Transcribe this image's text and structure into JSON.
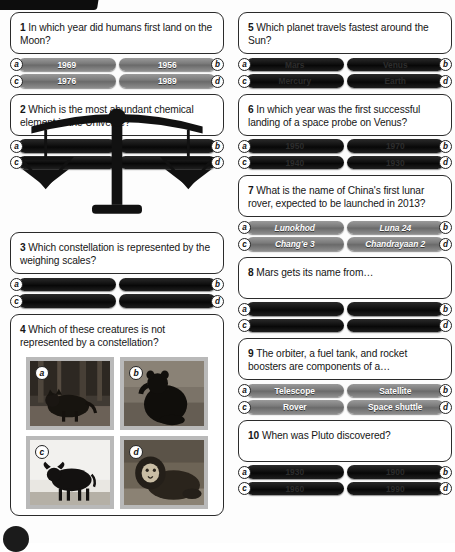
{
  "page": {
    "background_color": "#fdfdfd",
    "card_border_color": "#2b2b2b",
    "answer_button_color": "#7b7b7b",
    "answer_button_redacted_color": "#101010",
    "accent_black": "#0d0d0d"
  },
  "decorations": {
    "top_bar_name": "black-corner-bar",
    "bottom_dot_name": "black-corner-dot",
    "scales_name": "weighing-scales-illustration"
  },
  "questions": [
    {
      "number": "1",
      "text": "In which year did humans first land on the Moon?",
      "redacted": false,
      "answers": [
        {
          "key": "a",
          "label": "1969",
          "side": "left"
        },
        {
          "key": "b",
          "label": "1956",
          "side": "right"
        },
        {
          "key": "c",
          "label": "1976",
          "side": "left"
        },
        {
          "key": "d",
          "label": "1989",
          "side": "right"
        }
      ]
    },
    {
      "number": "2",
      "text": "Which is the most abundant chemical element in the Universe?",
      "redacted": true,
      "answers": [
        {
          "key": "a",
          "label": "",
          "side": "left"
        },
        {
          "key": "b",
          "label": "",
          "side": "right"
        },
        {
          "key": "c",
          "label": "",
          "side": "left"
        },
        {
          "key": "d",
          "label": "",
          "side": "right"
        }
      ]
    },
    {
      "number": "3",
      "text": "Which constellation is represented by the weighing scales?",
      "redacted": true,
      "answers": [
        {
          "key": "a",
          "label": "",
          "side": "left"
        },
        {
          "key": "b",
          "label": "",
          "side": "right"
        },
        {
          "key": "c",
          "label": "",
          "side": "left"
        },
        {
          "key": "d",
          "label": "",
          "side": "right"
        }
      ]
    },
    {
      "number": "4",
      "text": "Which of these creatures is not represented by a constellation?",
      "redacted": false,
      "answers": [],
      "pictures": [
        {
          "key": "a",
          "subject": "wolf-photo"
        },
        {
          "key": "b",
          "subject": "bear-photo"
        },
        {
          "key": "c",
          "subject": "bull-photo"
        },
        {
          "key": "d",
          "subject": "lion-photo"
        }
      ]
    },
    {
      "number": "5",
      "text": "Which planet travels fastest around the Sun?",
      "redacted": false,
      "answers": [
        {
          "key": "a",
          "label": "Mars",
          "side": "left"
        },
        {
          "key": "b",
          "label": "Venus",
          "side": "right"
        },
        {
          "key": "c",
          "label": "Mercury",
          "side": "left"
        },
        {
          "key": "d",
          "label": "Earth",
          "side": "right"
        }
      ]
    },
    {
      "number": "6",
      "text": "In which year was the first successful landing of a space probe on Venus?",
      "redacted": true,
      "answers": [
        {
          "key": "a",
          "label": "1950",
          "side": "left"
        },
        {
          "key": "b",
          "label": "1970",
          "side": "right"
        },
        {
          "key": "c",
          "label": "1940",
          "side": "left"
        },
        {
          "key": "d",
          "label": "1930",
          "side": "right"
        }
      ]
    },
    {
      "number": "7",
      "text": "What is the name of China's first lunar rover, expected to be launched in 2013?",
      "redacted": false,
      "italic": true,
      "answers": [
        {
          "key": "a",
          "label": "Lunokhod",
          "side": "left"
        },
        {
          "key": "b",
          "label": "Luna 24",
          "side": "right"
        },
        {
          "key": "c",
          "label": "Chang'e 3",
          "side": "left"
        },
        {
          "key": "d",
          "label": "Chandrayaan 2",
          "side": "right"
        }
      ]
    },
    {
      "number": "8",
      "text": "Mars gets its name from…",
      "redacted": true,
      "answers": [
        {
          "key": "a",
          "label": "",
          "side": "left"
        },
        {
          "key": "b",
          "label": "",
          "side": "right"
        },
        {
          "key": "c",
          "label": "",
          "side": "left"
        },
        {
          "key": "d",
          "label": "",
          "side": "right"
        }
      ]
    },
    {
      "number": "9",
      "text": "The orbiter, a fuel tank, and rocket boosters are components of a…",
      "redacted": false,
      "answers": [
        {
          "key": "a",
          "label": "Telescope",
          "side": "left"
        },
        {
          "key": "b",
          "label": "Satellite",
          "side": "right"
        },
        {
          "key": "c",
          "label": "Rover",
          "side": "left"
        },
        {
          "key": "d",
          "label": "Space shuttle",
          "side": "right"
        }
      ]
    },
    {
      "number": "10",
      "text": "When was Pluto discovered?",
      "redacted": false,
      "answers": [
        {
          "key": "a",
          "label": "1930",
          "side": "left"
        },
        {
          "key": "b",
          "label": "1900",
          "side": "right"
        },
        {
          "key": "c",
          "label": "1960",
          "side": "left"
        },
        {
          "key": "d",
          "label": "1990",
          "side": "right"
        }
      ]
    }
  ]
}
